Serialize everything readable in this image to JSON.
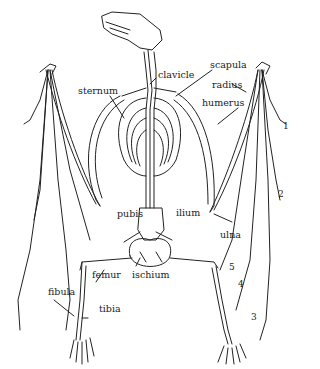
{
  "diagram": {
    "labels": {
      "sternum": "sternum",
      "clavicle": "clavicle",
      "scapula": "scapula",
      "radius": "radius",
      "humerus": "humerus",
      "ulna": "ulna",
      "pubis": "pubis",
      "ilium": "ilium",
      "ischium": "ischium",
      "femur": "femur",
      "fibula": "fibula",
      "tibia": "tibia"
    },
    "digit_numbers": [
      "1",
      "2",
      "3",
      "4",
      "5"
    ],
    "colors": {
      "line": "#222222",
      "background": "#ffffff"
    }
  }
}
